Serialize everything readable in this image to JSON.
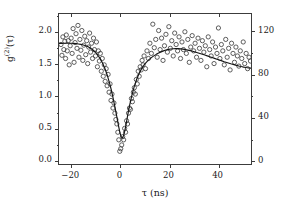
{
  "chart_data": {
    "type": "scatter",
    "title": "",
    "xlabel": "τ (ns)",
    "ylabel": "g(2)(τ)",
    "ylabel_base": "g",
    "ylabel_sup": "(2)",
    "ylabel_arg": "(τ)",
    "xlim": [
      -25,
      54
    ],
    "ylim": [
      -0.08,
      2.28
    ],
    "y2lim": [
      -4.4,
      136
    ],
    "grid": false,
    "legend": null,
    "marker": "open-circle",
    "xticks": [
      -20,
      0,
      20,
      40
    ],
    "xtick_labels": [
      "−20",
      "0",
      "20",
      "40"
    ],
    "xticks_minor": [
      -10,
      10,
      30,
      50
    ],
    "yticks": [
      0.0,
      0.5,
      1.0,
      1.5,
      2.0
    ],
    "ytick_labels": [
      "0.0",
      "0.5",
      "1.0",
      "1.5",
      "2.0"
    ],
    "y2ticks": [
      0,
      40,
      80,
      120
    ],
    "y2tick_labels": [
      "0",
      "40",
      "80",
      "120"
    ],
    "y2ticks_minor": [
      20,
      60,
      100
    ],
    "series": [
      {
        "name": "coincidence counts",
        "type": "scatter",
        "marker": "open-circle",
        "color": "#404040",
        "x": [
          -24.2,
          -23.8,
          -23.4,
          -23.0,
          -22.6,
          -22.3,
          -22.0,
          -21.6,
          -21.2,
          -20.8,
          -20.4,
          -20.0,
          -19.6,
          -19.2,
          -18.8,
          -18.4,
          -18.0,
          -17.6,
          -17.2,
          -16.8,
          -16.4,
          -16.0,
          -15.6,
          -15.2,
          -14.8,
          -14.4,
          -14.0,
          -13.6,
          -13.2,
          -12.8,
          -12.4,
          -12.0,
          -11.6,
          -11.2,
          -10.8,
          -10.4,
          -10.0,
          -9.6,
          -9.2,
          -8.8,
          -8.4,
          -8.0,
          -7.6,
          -7.2,
          -6.8,
          -6.4,
          -6.0,
          -5.6,
          -5.2,
          -4.8,
          -4.4,
          -4.0,
          -3.6,
          -3.2,
          -2.8,
          -2.4,
          -2.0,
          -1.6,
          -1.2,
          -0.8,
          -0.4,
          0.0,
          0.4,
          0.8,
          1.2,
          1.6,
          2.0,
          2.4,
          2.8,
          3.2,
          3.6,
          4.0,
          4.4,
          4.8,
          5.2,
          5.6,
          6.0,
          6.4,
          6.8,
          7.2,
          7.6,
          8.0,
          8.4,
          8.8,
          9.2,
          9.6,
          10.0,
          10.6,
          11.2,
          11.8,
          12.4,
          13.0,
          13.6,
          14.2,
          14.8,
          15.4,
          16.0,
          16.6,
          17.2,
          17.8,
          18.4,
          19.0,
          19.6,
          20.2,
          20.8,
          21.4,
          22.0,
          22.6,
          23.2,
          23.8,
          24.4,
          25.0,
          25.6,
          26.2,
          26.8,
          27.4,
          28.0,
          28.6,
          29.2,
          29.8,
          30.4,
          31.0,
          31.6,
          32.2,
          32.8,
          33.4,
          34.0,
          34.6,
          35.2,
          35.8,
          36.4,
          37.0,
          37.6,
          38.2,
          38.8,
          39.4,
          40.0,
          40.6,
          41.2,
          41.8,
          42.4,
          43.0,
          43.6,
          44.2,
          44.8,
          45.4,
          46.0,
          46.6,
          47.2,
          47.8,
          48.4,
          49.0,
          49.6,
          50.2,
          50.8,
          51.4,
          52.0,
          52.6,
          53.2,
          53.8
        ],
        "y": [
          1.8,
          1.63,
          1.92,
          1.72,
          1.85,
          1.58,
          1.95,
          1.7,
          1.86,
          1.48,
          1.78,
          1.9,
          1.66,
          2.05,
          1.52,
          1.83,
          1.97,
          1.74,
          2.1,
          1.6,
          1.88,
          1.71,
          2.02,
          1.55,
          1.79,
          1.93,
          1.64,
          1.86,
          1.5,
          1.76,
          1.98,
          1.68,
          1.82,
          1.58,
          1.9,
          1.72,
          1.62,
          1.84,
          1.45,
          1.7,
          1.54,
          1.66,
          1.38,
          1.58,
          1.3,
          1.48,
          1.22,
          1.42,
          1.15,
          1.33,
          1.05,
          1.18,
          0.92,
          1.02,
          0.8,
          0.88,
          0.72,
          0.62,
          0.55,
          0.42,
          0.3,
          0.12,
          0.16,
          0.22,
          0.35,
          0.3,
          0.48,
          0.42,
          0.6,
          0.55,
          0.72,
          0.8,
          0.78,
          0.95,
          0.9,
          1.05,
          1.12,
          1.02,
          1.25,
          1.18,
          1.38,
          1.3,
          1.45,
          1.4,
          1.55,
          1.48,
          1.62,
          1.42,
          1.7,
          1.58,
          1.82,
          1.66,
          2.12,
          1.75,
          1.88,
          1.6,
          2.02,
          1.72,
          1.9,
          1.55,
          1.78,
          1.96,
          1.68,
          2.08,
          1.74,
          1.86,
          1.62,
          1.98,
          1.8,
          1.7,
          1.92,
          1.58,
          1.84,
          1.72,
          2.0,
          1.66,
          1.88,
          1.52,
          1.76,
          1.94,
          1.7,
          1.82,
          1.6,
          1.9,
          1.74,
          1.55,
          1.86,
          1.68,
          1.78,
          1.45,
          1.92,
          1.72,
          1.62,
          1.84,
          1.5,
          1.76,
          1.66,
          2.06,
          1.58,
          1.8,
          1.7,
          1.48,
          1.88,
          1.6,
          1.74,
          1.4,
          1.82,
          1.66,
          1.52,
          1.76,
          1.62,
          1.46,
          1.7,
          1.58,
          1.84,
          1.5,
          1.66,
          1.42,
          1.6,
          1.54
        ]
      },
      {
        "name": "fit",
        "type": "line",
        "color": "#141414",
        "x": [
          -25,
          -24,
          -23,
          -22,
          -21,
          -20,
          -19,
          -18,
          -17,
          -16,
          -15,
          -14,
          -13,
          -12,
          -11,
          -10,
          -9,
          -8,
          -7,
          -6,
          -5,
          -4,
          -3.5,
          -3,
          -2.5,
          -2,
          -1.5,
          -1,
          -0.5,
          0,
          0.5,
          1,
          1.5,
          2,
          2.5,
          3,
          3.5,
          4,
          5,
          6,
          7,
          8,
          9,
          10,
          11,
          12,
          13,
          14,
          15,
          16,
          17,
          18,
          19,
          20,
          21,
          22,
          23,
          24,
          25,
          26,
          27,
          28,
          29,
          30,
          31,
          32,
          33,
          34,
          35,
          36,
          37,
          38,
          39,
          40,
          41,
          42,
          43,
          44,
          45,
          46,
          47,
          48,
          49,
          50,
          51,
          52,
          53,
          54
        ],
        "y": [
          1.817,
          1.818,
          1.819,
          1.82,
          1.82,
          1.819,
          1.817,
          1.814,
          1.809,
          1.802,
          1.793,
          1.78,
          1.764,
          1.742,
          1.714,
          1.678,
          1.632,
          1.574,
          1.501,
          1.411,
          1.3,
          1.165,
          1.088,
          1.004,
          0.915,
          0.82,
          0.722,
          0.621,
          0.52,
          0.425,
          0.355,
          0.33,
          0.36,
          0.43,
          0.525,
          0.63,
          0.735,
          0.835,
          1.005,
          1.145,
          1.258,
          1.348,
          1.42,
          1.478,
          1.524,
          1.562,
          1.594,
          1.621,
          1.645,
          1.666,
          1.684,
          1.7,
          1.713,
          1.723,
          1.73,
          1.734,
          1.736,
          1.735,
          1.732,
          1.727,
          1.72,
          1.712,
          1.703,
          1.693,
          1.682,
          1.671,
          1.659,
          1.647,
          1.634,
          1.621,
          1.608,
          1.595,
          1.582,
          1.569,
          1.556,
          1.543,
          1.53,
          1.518,
          1.506,
          1.494,
          1.483,
          1.472,
          1.462,
          1.453,
          1.445,
          1.438,
          1.432,
          1.428
        ]
      }
    ]
  }
}
